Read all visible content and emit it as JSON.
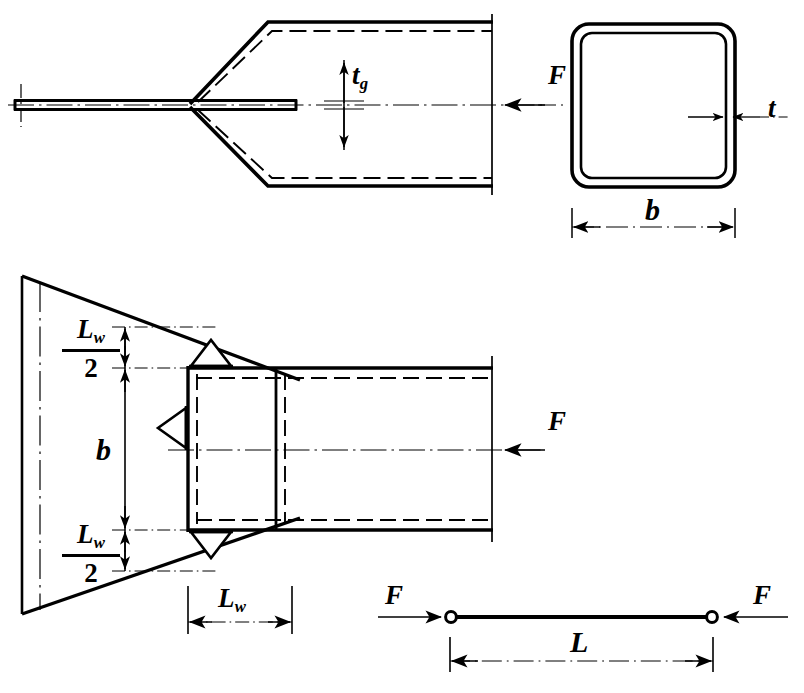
{
  "drawing": {
    "title": "Welded gusset plate to square hollow section strut connection",
    "line_color": "#000000",
    "background": "#ffffff"
  },
  "views": {
    "side_elevation": {
      "name": "Side elevation of slotted tube end with gusset plate",
      "labels": {
        "gusset_thickness": "t",
        "gusset_thickness_sub": "g",
        "force": "F"
      }
    },
    "cross_section": {
      "name": "Square hollow section cross-section",
      "labels": {
        "width": "b",
        "wall_thickness": "t"
      }
    },
    "plan_view": {
      "name": "Plan view of welded connection",
      "labels": {
        "weld_half_num": "L",
        "weld_half_num_sub": "w",
        "weld_half_den": "2",
        "width": "b",
        "weld_length": "L",
        "weld_length_sub": "w",
        "force": "F"
      }
    },
    "strut_schematic": {
      "name": "Pin-ended strut load schematic",
      "labels": {
        "force_left": "F",
        "force_right": "F",
        "length": "L"
      }
    }
  }
}
